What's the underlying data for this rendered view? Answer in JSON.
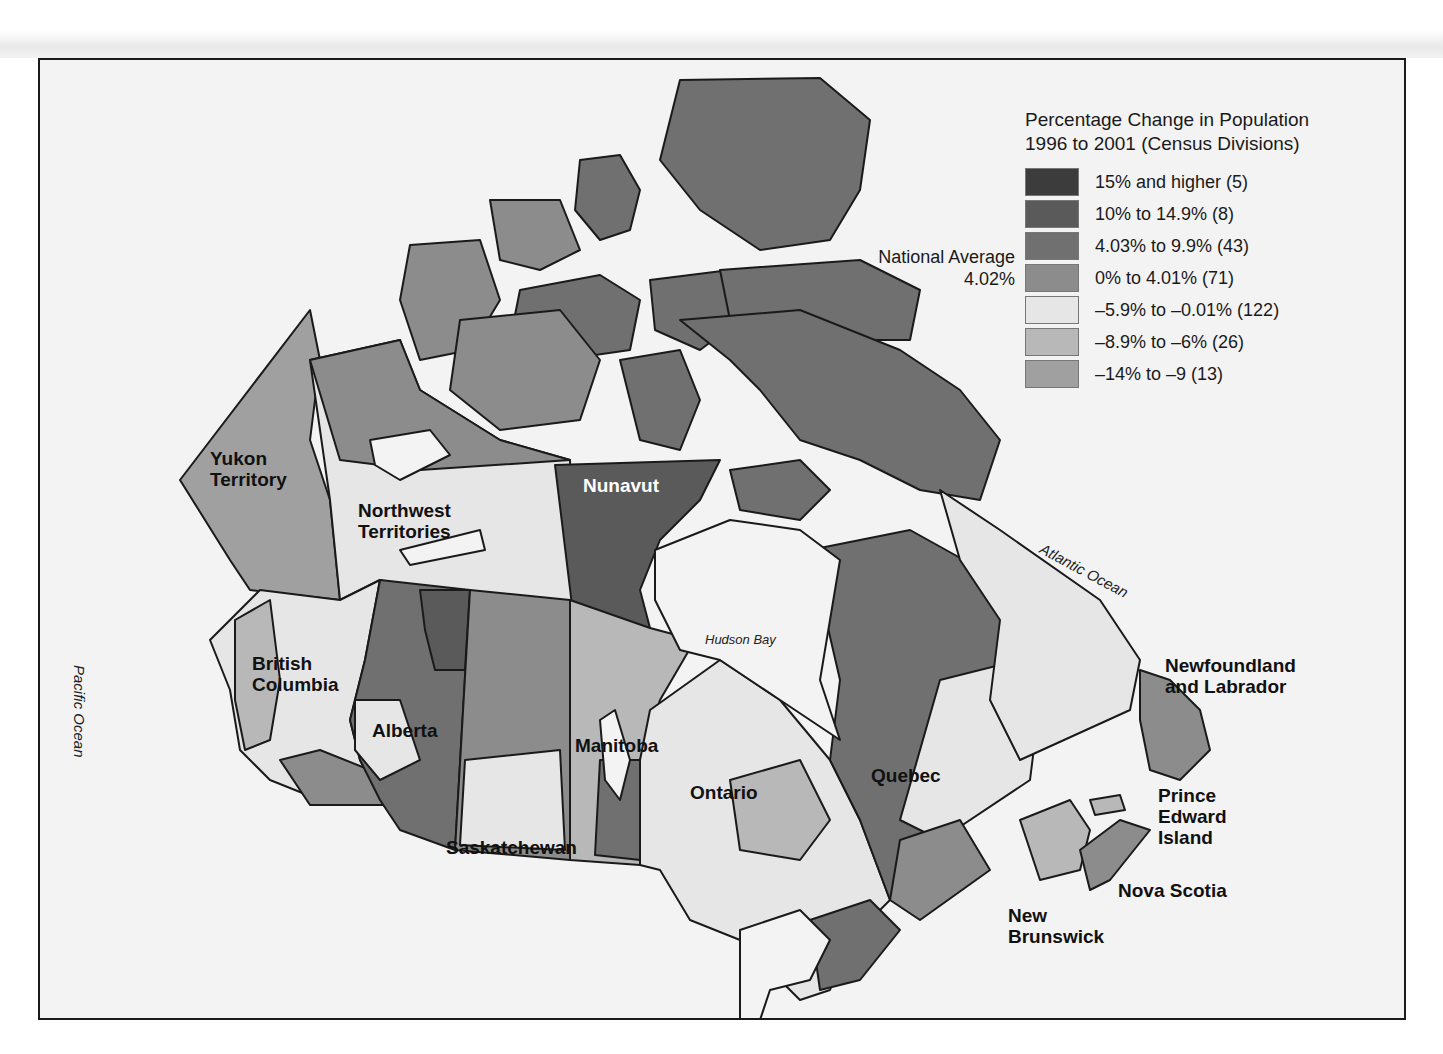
{
  "legend": {
    "title_line1": "Percentage Change in Population",
    "title_line2": "1996 to 2001 (Census Divisions)",
    "items": [
      {
        "label": "15% and higher (5)",
        "color": "#3c3c3c"
      },
      {
        "label": "10% to 14.9% (8)",
        "color": "#5a5a5a"
      },
      {
        "label": "4.03% to 9.9% (43)",
        "color": "#707070"
      },
      {
        "label": "0% to 4.01% (71)",
        "color": "#8c8c8c"
      },
      {
        "label": "–5.9% to –0.01% (122)",
        "color": "#e6e6e6"
      },
      {
        "label": "–8.9% to –6% (26)",
        "color": "#b8b8b8"
      },
      {
        "label": "–14% to –9 (13)",
        "color": "#a0a0a0"
      }
    ]
  },
  "national_average": {
    "label": "National Average",
    "value": "4.02%"
  },
  "regions": {
    "yukon": "Yukon\nTerritory",
    "nwt": "Northwest\nTerritories",
    "nunavut": "Nunavut",
    "bc": "British\nColumbia",
    "alberta": "Alberta",
    "saskatchewan": "Saskatchewan",
    "manitoba": "Manitoba",
    "ontario": "Ontario",
    "quebec": "Quebec",
    "nl": "Newfoundland\nand Labrador",
    "pei": "Prince\nEdward\nIsland",
    "ns": "Nova Scotia",
    "nb": "New\nBrunswick"
  },
  "water_bodies": {
    "pacific": "Pacific  Ocean",
    "atlantic": "Atlantic  Ocean",
    "hudson": "Hudson Bay"
  },
  "colors": {
    "background": "#f3f3f3",
    "border": "#1a1a1a",
    "water": "#f3f3f3"
  }
}
